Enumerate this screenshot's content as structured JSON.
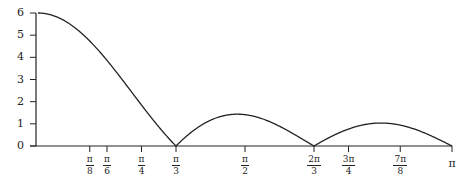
{
  "chart_data": {
    "type": "line",
    "title": "",
    "xlabel": "",
    "ylabel": "",
    "function": "|sin(3x) / sin(x/2)|",
    "xlim": [
      0,
      3.14159
    ],
    "ylim": [
      0,
      6
    ],
    "grid": false,
    "legend": null,
    "y_ticks": [
      {
        "value": 0,
        "label": "0"
      },
      {
        "value": 1,
        "label": "1"
      },
      {
        "value": 2,
        "label": "2"
      },
      {
        "value": 3,
        "label": "3"
      },
      {
        "value": 4,
        "label": "4"
      },
      {
        "value": 5,
        "label": "5"
      },
      {
        "value": 6,
        "label": "6"
      }
    ],
    "x_ticks": [
      {
        "value": 0.3927,
        "num": "π",
        "den": "8"
      },
      {
        "value": 0.5236,
        "num": "π",
        "den": "6"
      },
      {
        "value": 0.7854,
        "num": "π",
        "den": "4"
      },
      {
        "value": 1.0472,
        "num": "π",
        "den": "3"
      },
      {
        "value": 1.5708,
        "num": "π",
        "den": "2"
      },
      {
        "value": 2.0944,
        "num": "2π",
        "den": "3"
      },
      {
        "value": 2.3562,
        "num": "3π",
        "den": "4"
      },
      {
        "value": 2.7489,
        "num": "7π",
        "den": "8"
      },
      {
        "value": 3.1416,
        "num": "π",
        "den": ""
      }
    ],
    "series": [
      {
        "name": "f(x)",
        "x": [
          0,
          0.1309,
          0.2618,
          0.3927,
          0.5236,
          0.6545,
          0.7854,
          0.9163,
          1.0472,
          1.1781,
          1.309,
          1.4399,
          1.5708,
          1.7017,
          1.8326,
          1.9635,
          2.0944,
          2.2253,
          2.3562,
          2.4871,
          2.618,
          2.7489,
          2.8798,
          3.0107,
          3.1416
        ],
        "y": [
          6.0,
          5.66,
          4.74,
          3.52,
          2.22,
          1.04,
          0.04,
          0.7,
          0.0,
          0.78,
          1.22,
          1.4,
          1.41,
          1.29,
          1.02,
          0.62,
          0.0,
          0.47,
          0.76,
          0.97,
          1.04,
          0.97,
          0.76,
          0.4,
          0.0
        ]
      }
    ]
  }
}
